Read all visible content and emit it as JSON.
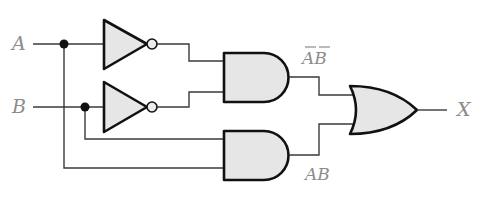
{
  "diagram": {
    "type": "logic-circuit",
    "inputs": [
      {
        "label": "A"
      },
      {
        "label": "B"
      }
    ],
    "output": {
      "label": "X"
    },
    "gates": [
      {
        "id": "not_a",
        "type": "NOT",
        "input": "A"
      },
      {
        "id": "not_b",
        "type": "NOT",
        "input": "B"
      },
      {
        "id": "and_1",
        "type": "AND",
        "inputs": [
          "not_a",
          "not_b"
        ],
        "output_label": {
          "letters": [
            "A",
            "B"
          ],
          "complemented": [
            true,
            true
          ]
        }
      },
      {
        "id": "and_2",
        "type": "AND",
        "inputs": [
          "B",
          "A"
        ],
        "output_label": {
          "letters": [
            "A",
            "B"
          ],
          "complemented": [
            false,
            false
          ]
        }
      },
      {
        "id": "or_1",
        "type": "OR",
        "inputs": [
          "and_1",
          "and_2"
        ],
        "output": "X"
      }
    ],
    "term_labels": {
      "and1": {
        "first": "A",
        "second": "B"
      },
      "and2": {
        "first": "A",
        "second": "B"
      }
    },
    "colors": {
      "gate_fill": "#e6e6e6",
      "gate_stroke": "#111111",
      "wire": "#3a3a3a",
      "label": "#8c8c8c"
    }
  }
}
